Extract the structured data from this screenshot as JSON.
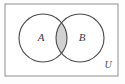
{
  "figure": {
    "type": "venn-diagram",
    "background_color": "#fdfdfd"
  },
  "universe": {
    "label": "U",
    "border_color": "#8f8f8f",
    "fill_color": "#ffffff",
    "x": 5,
    "y": 4,
    "width": 113,
    "height": 72,
    "label_x": 108,
    "label_y": 66
  },
  "sets": [
    {
      "name": "set-a",
      "label": "A",
      "cx": 43,
      "cy": 38,
      "r": 24,
      "label_x": 41,
      "label_y": 38,
      "stroke_color": "#4a4a4a",
      "fill_color": "#ffffff"
    },
    {
      "name": "set-b",
      "label": "B",
      "cx": 80,
      "cy": 38,
      "r": 24,
      "label_x": 82,
      "label_y": 38,
      "stroke_color": "#4a4a4a",
      "fill_color": "#ffffff"
    }
  ],
  "intersection": {
    "name": "a-intersect-b",
    "shaded": true,
    "fill_color": "#d2d2d2",
    "stroke_color": "#4a4a4a",
    "description": "A intersect B"
  }
}
